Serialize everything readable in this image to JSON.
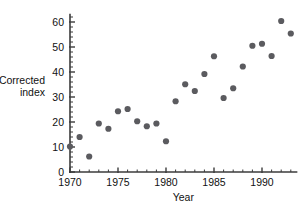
{
  "chart_data": {
    "type": "scatter",
    "title": "",
    "xlabel": "Year",
    "ylabel": "Corrected index",
    "ylabel_lines": [
      "Corrected",
      "index"
    ],
    "xlim": [
      1969.2,
      1993.6
    ],
    "ylim": [
      0,
      63
    ],
    "grid": false,
    "legend": null,
    "x_ticks": [
      1970,
      1975,
      1980,
      1985,
      1990
    ],
    "x_tick_labels": [
      "1970",
      "1975",
      "1980",
      "1985",
      "1990"
    ],
    "x_minor_ticks": [
      1971,
      1972,
      1973,
      1974,
      1976,
      1977,
      1978,
      1979,
      1981,
      1982,
      1983,
      1984,
      1986,
      1987,
      1988,
      1989,
      1991,
      1992,
      1993
    ],
    "y_ticks": [
      0,
      10,
      20,
      30,
      40,
      50,
      60
    ],
    "y_tick_labels": [
      "0",
      "10",
      "20",
      "30",
      "40",
      "50",
      "60"
    ],
    "y_minor_ticks": [
      2,
      4,
      6,
      8,
      12,
      14,
      16,
      18,
      22,
      24,
      26,
      28,
      32,
      34,
      36,
      38,
      42,
      44,
      46,
      48,
      52,
      54,
      56,
      58,
      62
    ],
    "marker": "circle",
    "marker_color": "#5b5b5f",
    "axis_color": "#3b3b3b",
    "x": [
      1970,
      1971,
      1972,
      1973,
      1974,
      1975,
      1976,
      1977,
      1978,
      1979,
      1980,
      1981,
      1982,
      1983,
      1984,
      1985,
      1986,
      1987,
      1988,
      1989,
      1990,
      1991,
      1992,
      1993
    ],
    "y": [
      10.2,
      14.0,
      6.2,
      19.4,
      17.3,
      24.3,
      25.2,
      20.3,
      18.3,
      19.4,
      12.3,
      28.3,
      35.1,
      32.4,
      39.2,
      46.3,
      29.6,
      33.5,
      42.2,
      50.5,
      51.3,
      46.4,
      60.4,
      55.4
    ],
    "points": [
      {
        "year": 1970,
        "value": 10.2
      },
      {
        "year": 1971,
        "value": 14.0
      },
      {
        "year": 1972,
        "value": 6.2
      },
      {
        "year": 1973,
        "value": 19.4
      },
      {
        "year": 1974,
        "value": 17.3
      },
      {
        "year": 1975,
        "value": 24.3
      },
      {
        "year": 1976,
        "value": 25.2
      },
      {
        "year": 1977,
        "value": 20.3
      },
      {
        "year": 1978,
        "value": 18.3
      },
      {
        "year": 1979,
        "value": 19.4
      },
      {
        "year": 1980,
        "value": 12.3
      },
      {
        "year": 1981,
        "value": 28.3
      },
      {
        "year": 1982,
        "value": 35.1
      },
      {
        "year": 1983,
        "value": 32.4
      },
      {
        "year": 1984,
        "value": 39.2
      },
      {
        "year": 1985,
        "value": 46.3
      },
      {
        "year": 1986,
        "value": 29.6
      },
      {
        "year": 1987,
        "value": 33.5
      },
      {
        "year": 1988,
        "value": 42.2
      },
      {
        "year": 1989,
        "value": 50.5
      },
      {
        "year": 1990,
        "value": 51.3
      },
      {
        "year": 1991,
        "value": 46.4
      },
      {
        "year": 1992,
        "value": 60.4
      },
      {
        "year": 1993,
        "value": 55.4
      }
    ]
  }
}
